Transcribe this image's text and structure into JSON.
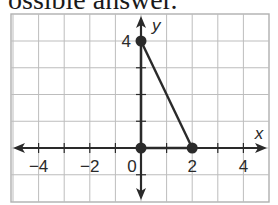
{
  "caption": "ossible answer.",
  "chart_data": {
    "type": "line",
    "title": "",
    "xlabel": "x",
    "ylabel": "y",
    "xlim": [
      -5,
      5
    ],
    "ylim": [
      -2,
      5
    ],
    "grid": true,
    "x_tick_labels": [
      "-4",
      "-2",
      "0",
      "2",
      "4"
    ],
    "y_tick_labels": [
      "4"
    ],
    "series": [
      {
        "name": "segment",
        "points": [
          [
            0,
            4
          ],
          [
            2,
            0
          ]
        ]
      },
      {
        "name": "segment-on-x-axis",
        "points": [
          [
            0,
            0
          ],
          [
            2,
            0
          ]
        ]
      },
      {
        "name": "segment-on-y-axis",
        "points": [
          [
            0,
            0
          ],
          [
            0,
            4
          ]
        ]
      }
    ],
    "marked_points": [
      [
        0,
        4
      ],
      [
        0,
        0
      ],
      [
        2,
        0
      ]
    ]
  },
  "colors": {
    "grid": "#bdbdbd",
    "axis": "#2a2a2a",
    "line": "#2a2a2a",
    "border": "#b0b0b0"
  }
}
